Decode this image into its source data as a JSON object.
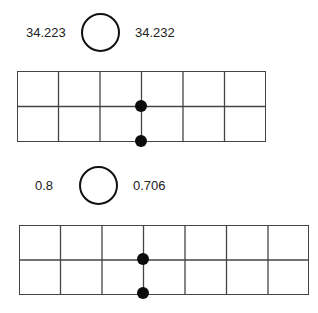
{
  "diagram": {
    "panels": [
      {
        "left_value": "34.223",
        "right_value": "34.232",
        "comparison_circle": "empty",
        "grid": {
          "columns": 6,
          "rows": 2
        },
        "markers": [
          {
            "column_line": 3,
            "row_line": 1
          },
          {
            "column_line": 3,
            "row_line": 2
          }
        ]
      },
      {
        "left_value": "0.8",
        "right_value": "0.706",
        "comparison_circle": "empty",
        "grid": {
          "columns": 7,
          "rows": 2
        },
        "markers": [
          {
            "column_line": 3,
            "row_line": 1
          },
          {
            "column_line": 3,
            "row_line": 2
          }
        ]
      }
    ]
  }
}
